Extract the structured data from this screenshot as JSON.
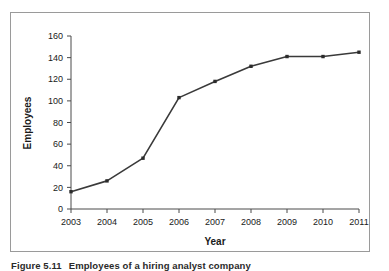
{
  "figure": {
    "caption_number": "Figure 5.11",
    "caption_text": "Employees of a hiring analyst company"
  },
  "chart_data": {
    "type": "line",
    "title": "",
    "xlabel": "Year",
    "ylabel": "Employees",
    "categories": [
      "2003",
      "2004",
      "2005",
      "2006",
      "2007",
      "2008",
      "2009",
      "2010",
      "2011"
    ],
    "values": [
      16,
      26,
      47,
      103,
      118,
      132,
      141,
      141,
      145
    ],
    "series": [
      {
        "name": "Employees",
        "values": [
          16,
          26,
          47,
          103,
          118,
          132,
          141,
          141,
          145
        ]
      }
    ],
    "ylim": [
      0,
      160
    ],
    "yticks": [
      0,
      20,
      40,
      60,
      80,
      100,
      120,
      140,
      160
    ],
    "ytick_labels": [
      "0",
      "20",
      "40",
      "60",
      "80",
      "100",
      "120",
      "140",
      "160"
    ],
    "xtick_labels": [
      "2003",
      "2004",
      "2005",
      "2006",
      "2007",
      "2008",
      "2009",
      "2010",
      "2011"
    ],
    "grid": false,
    "legend": "none",
    "marker": "square",
    "line_color": "#3a3a3a",
    "marker_color": "#2b2b2b",
    "axis_color": "#4a4a4a",
    "plot_background": "#ffffff"
  }
}
